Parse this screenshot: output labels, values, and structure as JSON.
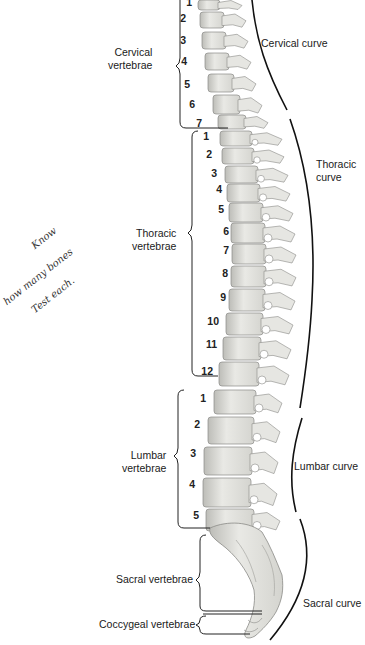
{
  "diagram": {
    "regions": [
      {
        "id": "cervical",
        "label_line1": "Cervical",
        "label_line2": "vertebrae",
        "numbers": [
          "1",
          "2",
          "3",
          "4",
          "5",
          "6",
          "7"
        ]
      },
      {
        "id": "thoracic",
        "label_line1": "Thoracic",
        "label_line2": "vertebrae",
        "numbers": [
          "1",
          "2",
          "3",
          "4",
          "5",
          "6",
          "7",
          "8",
          "9",
          "10",
          "11",
          "12"
        ]
      },
      {
        "id": "lumbar",
        "label_line1": "Lumbar",
        "label_line2": "vertebrae",
        "numbers": [
          "1",
          "2",
          "3",
          "4",
          "5"
        ]
      },
      {
        "id": "sacral",
        "label_line1": "Sacral vertebrae",
        "numbers": []
      },
      {
        "id": "coccygeal",
        "label_line1": "Coccygeal vertebrae",
        "numbers": []
      }
    ],
    "curves": [
      {
        "id": "cervical-curve",
        "label_line1": "Cervical curve"
      },
      {
        "id": "thoracic-curve",
        "label_line1": "Thoracic",
        "label_line2": "curve"
      },
      {
        "id": "lumbar-curve",
        "label_line1": "Lumbar curve"
      },
      {
        "id": "sacral-curve",
        "label_line1": "Sacral curve"
      }
    ],
    "annotation": {
      "line1": "Know",
      "line2": "how many bones",
      "line3": "Test each."
    },
    "colors": {
      "bone_fill": "#e6e6e2",
      "bone_shade": "#c9c9c4",
      "bone_outline": "#8a8a86",
      "line": "#111111"
    }
  }
}
